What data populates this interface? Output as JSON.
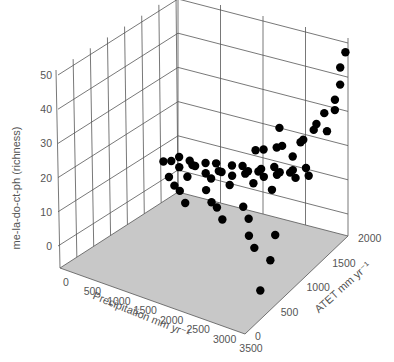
{
  "chart_data": {
    "type": "scatter3d",
    "title": "",
    "xlabel": "Precipitation mm yr⁻¹",
    "ylabel": "ATET mm yr⁻¹",
    "zlabel": "me-la-do-ct-ph (richness)",
    "xlim": [
      0,
      3500
    ],
    "ylim": [
      0,
      2000
    ],
    "zlim": [
      0,
      50
    ],
    "xticks": [
      "0",
      "500",
      "1000",
      "1500",
      "2000",
      "2500",
      "3000",
      "3500"
    ],
    "yticks": [
      "0",
      "500",
      "1000",
      "1500",
      "2000"
    ],
    "zticks": [
      "0",
      "10",
      "20",
      "30",
      "40",
      "50"
    ],
    "grid": true,
    "floor_color": "#c8c8c8",
    "marker_color": "#000000",
    "points_description": "Dense cloud of ~400 sites; richness low (0-10) at low precipitation/ATET, rising steeply at high ATET (1500-2000) and high precipitation (2500-3500) up to ~48",
    "points": [
      [
        300,
        1700,
        2
      ],
      [
        400,
        1750,
        2
      ],
      [
        500,
        1800,
        3
      ],
      [
        600,
        1700,
        2
      ],
      [
        700,
        1800,
        3
      ],
      [
        800,
        1750,
        3
      ],
      [
        900,
        1700,
        4
      ],
      [
        1000,
        1800,
        4
      ],
      [
        1100,
        1700,
        3
      ],
      [
        1200,
        1800,
        5
      ],
      [
        1300,
        1750,
        4
      ],
      [
        1400,
        1700,
        5
      ],
      [
        1500,
        1800,
        6
      ],
      [
        1600,
        1700,
        5
      ],
      [
        1700,
        1800,
        7
      ],
      [
        1800,
        1750,
        6
      ],
      [
        1900,
        1700,
        8
      ],
      [
        2000,
        1800,
        7
      ],
      [
        2100,
        1750,
        9
      ],
      [
        2200,
        1700,
        8
      ],
      [
        2300,
        1800,
        10
      ],
      [
        2400,
        1750,
        9
      ],
      [
        2500,
        1700,
        11
      ],
      [
        2600,
        1800,
        10
      ],
      [
        2700,
        1750,
        12
      ],
      [
        2800,
        1700,
        11
      ],
      [
        2900,
        1800,
        13
      ],
      [
        3000,
        1750,
        12
      ],
      [
        800,
        1400,
        2
      ],
      [
        1000,
        1300,
        3
      ],
      [
        1200,
        1200,
        2
      ],
      [
        1400,
        1400,
        4
      ],
      [
        1600,
        1300,
        3
      ],
      [
        1800,
        1200,
        4
      ],
      [
        2000,
        1100,
        3
      ],
      [
        2200,
        1300,
        5
      ],
      [
        2400,
        1200,
        4
      ],
      [
        2600,
        1000,
        3
      ],
      [
        2800,
        900,
        2
      ],
      [
        3000,
        1100,
        4
      ],
      [
        3200,
        800,
        2
      ],
      [
        3400,
        400,
        0
      ],
      [
        600,
        1500,
        2
      ],
      [
        900,
        1550,
        3
      ],
      [
        1300,
        1600,
        4
      ],
      [
        1700,
        1550,
        5
      ],
      [
        2100,
        1600,
        7
      ],
      [
        2500,
        1550,
        8
      ],
      [
        2600,
        1850,
        14
      ],
      [
        2700,
        1900,
        18
      ],
      [
        2800,
        1850,
        20
      ],
      [
        2900,
        1950,
        22
      ],
      [
        3000,
        1900,
        25
      ],
      [
        3100,
        1950,
        28
      ],
      [
        3200,
        1900,
        24
      ],
      [
        3300,
        1950,
        30
      ],
      [
        3350,
        1900,
        34
      ],
      [
        3400,
        1950,
        38
      ],
      [
        3450,
        1900,
        44
      ],
      [
        3500,
        1950,
        48
      ],
      [
        2400,
        1850,
        16
      ],
      [
        2300,
        1900,
        20
      ],
      [
        2200,
        1950,
        13
      ],
      [
        2000,
        1900,
        12
      ],
      [
        1800,
        1950,
        10
      ]
    ]
  }
}
